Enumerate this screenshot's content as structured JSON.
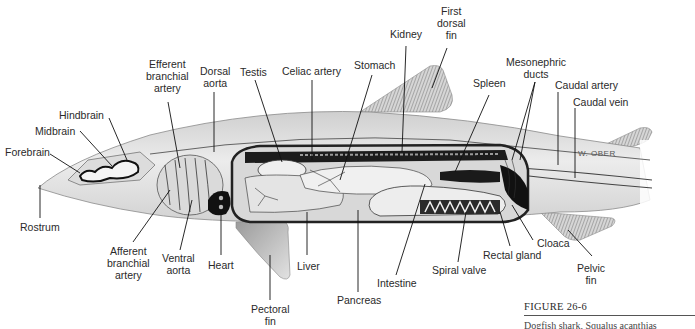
{
  "figure": {
    "number": "FIGURE 26-6",
    "caption_partial": "Dogfish shark, Squalus acanthias",
    "signature": "W. OBER"
  },
  "colors": {
    "background": "#ffffff",
    "body_light": "#e6e6e6",
    "body_mid": "#bdbdbd",
    "body_dark": "#1a1a1a",
    "label_text": "#2a2a2a",
    "leader_line": "#111111"
  },
  "labels": {
    "forebrain": "Forebrain",
    "midbrain": "Midbrain",
    "hindbrain": "Hindbrain",
    "efferent_branchial_artery": [
      "Efferent",
      "branchial",
      "artery"
    ],
    "dorsal_aorta": [
      "Dorsal",
      "aorta"
    ],
    "testis": "Testis",
    "celiac_artery": "Celiac artery",
    "stomach": "Stomach",
    "kidney": "Kidney",
    "first_dorsal_fin": [
      "First",
      "dorsal",
      "fin"
    ],
    "spleen": "Spleen",
    "mesonephric_ducts": [
      "Mesonephric",
      "ducts"
    ],
    "caudal_artery": "Caudal artery",
    "caudal_vein": "Caudal vein",
    "rostrum": "Rostrum",
    "afferent_branchial_artery": [
      "Afferent",
      "branchial",
      "artery"
    ],
    "ventral_aorta": [
      "Ventral",
      "aorta"
    ],
    "heart": "Heart",
    "pectoral_fin": [
      "Pectoral",
      "fin"
    ],
    "liver": "Liver",
    "pancreas": "Pancreas",
    "intestine": "Intestine",
    "spiral_valve": "Spiral valve",
    "rectal_gland": "Rectal gland",
    "cloaca": "Cloaca",
    "pelvic_fin": [
      "Pelvic",
      "fin"
    ]
  }
}
